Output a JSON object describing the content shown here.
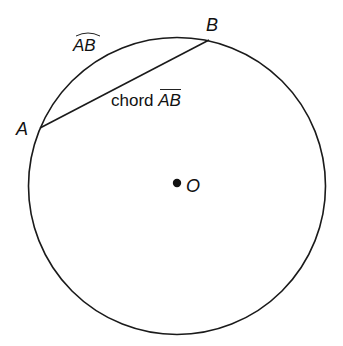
{
  "diagram": {
    "circle": {
      "center": {
        "x": 177,
        "y": 186
      },
      "radius": 148,
      "stroke": "#1a1a1a"
    },
    "points": [
      {
        "id": "A",
        "label": "A",
        "x": 40,
        "y": 128
      },
      {
        "id": "B",
        "label": "B",
        "x": 209,
        "y": 40
      },
      {
        "id": "O",
        "label": "O",
        "x": 177,
        "y": 183,
        "is_center": true
      }
    ],
    "chord": {
      "from": "A",
      "to": "B",
      "prefix": "chord",
      "name": "AB",
      "notation": "overline"
    },
    "arc": {
      "from": "A",
      "to": "B",
      "name": "AB",
      "notation": "arc-overmark"
    },
    "labels": {
      "point_a": "A",
      "point_b": "B",
      "center_o": "O",
      "arc_label": "AB",
      "chord_word": "chord",
      "chord_name": "AB"
    }
  }
}
